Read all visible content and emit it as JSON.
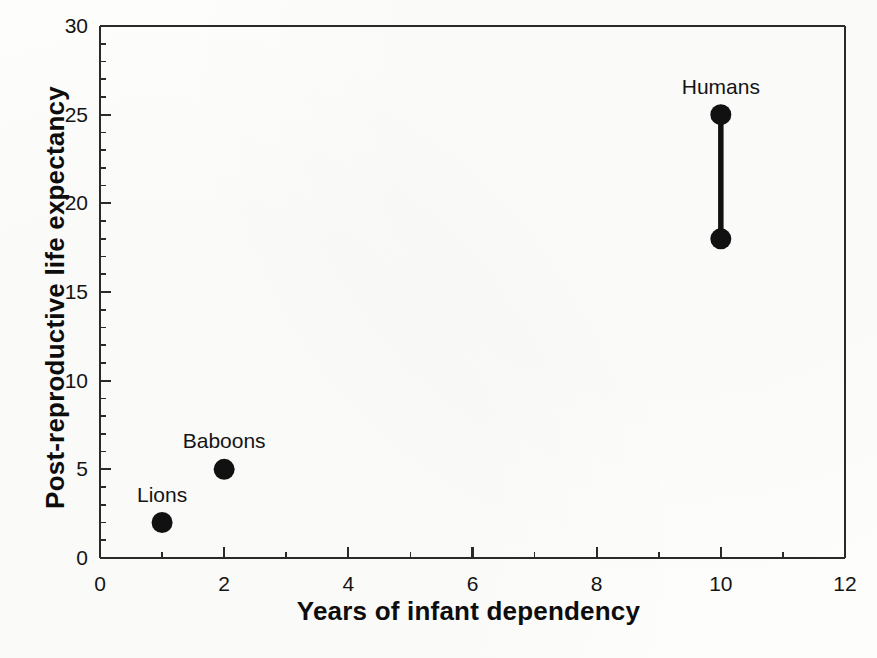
{
  "chart_data": {
    "type": "scatter",
    "title": "",
    "xlabel": "Years of infant dependency",
    "ylabel": "Post-reproductive life expectancy",
    "xlim": [
      0,
      12
    ],
    "ylim": [
      0,
      30
    ],
    "x_major_ticks": [
      0,
      2,
      4,
      6,
      8,
      10,
      12
    ],
    "x_tick_labels": [
      "0",
      "2",
      "4",
      "6",
      "8",
      "10",
      "12"
    ],
    "x_minor_tick_step": 1,
    "y_major_ticks": [
      0,
      5,
      10,
      15,
      20,
      25,
      30
    ],
    "y_tick_labels": [
      "0",
      "5",
      "10",
      "15",
      "20",
      "25",
      "30"
    ],
    "y_minor_tick_step": 1,
    "grid": false,
    "legend": "none",
    "marker_color": "#111111",
    "axis_color": "#2a2a2a",
    "background_color": "#fdfdfc",
    "points": [
      {
        "label": "Lions",
        "x": 1,
        "y": 2,
        "label_dx": 0,
        "label_dy": -26
      },
      {
        "label": "Baboons",
        "x": 2,
        "y": 5,
        "label_dx": 0,
        "label_dy": -26
      },
      {
        "label": "Humans",
        "x": 10,
        "y": 25,
        "label_dx": 0,
        "label_dy": -26
      }
    ],
    "ranges": [
      {
        "label": "Humans",
        "x": 10,
        "y_low": 18,
        "y_high": 25,
        "note": "vertical bar joining two filled circles"
      }
    ],
    "series": [
      {
        "name": "Post-reproductive life expectancy vs years of infant dependency",
        "x": [
          1,
          2,
          10,
          10
        ],
        "y": [
          2,
          5,
          18,
          25
        ]
      }
    ]
  },
  "figure": {
    "caption_fragment": ""
  }
}
